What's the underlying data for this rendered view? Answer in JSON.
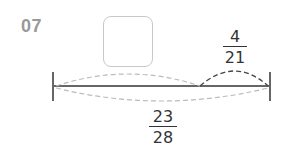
{
  "problem": {
    "number": "07",
    "answer_box": "",
    "segment_fraction": {
      "numerator": "4",
      "denominator": "21"
    },
    "total_fraction": {
      "numerator": "23",
      "denominator": "28"
    }
  },
  "colors": {
    "line": "#333333",
    "dashed_light": "#bbbbbb",
    "dashed_dark": "#444444",
    "number": "#999999"
  }
}
